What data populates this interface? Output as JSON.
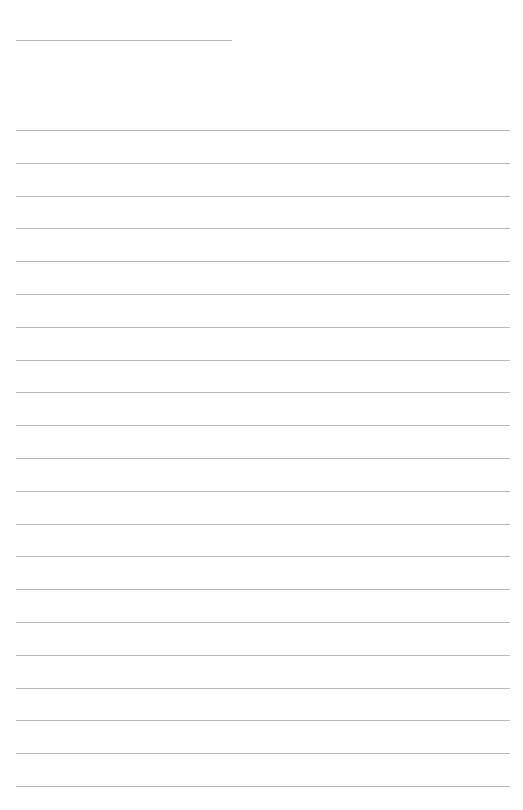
{
  "page": {
    "type": "lined-paper",
    "background": "#ffffff",
    "line_color": "#b9b9b9",
    "header_line": {
      "top": 40,
      "left": 16,
      "width": 216
    },
    "ruled_lines": {
      "count": 21,
      "first_top": 130,
      "spacing": 32.8,
      "left": 16,
      "width": 494
    }
  }
}
